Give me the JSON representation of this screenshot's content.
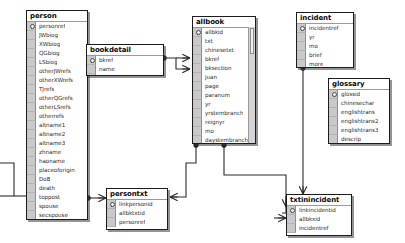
{
  "diagram": {
    "type": "entity-relationship-diagram",
    "background_color": "#ffffff",
    "line_color": "#2b2b2b"
  },
  "tables": [
    {
      "id": "person",
      "name": "person",
      "x": 26,
      "y": 10,
      "width": 62,
      "height": 210,
      "has_scrollbar": false,
      "fields": [
        {
          "name": "personref",
          "key": true
        },
        {
          "name": "JWbiog",
          "key": false
        },
        {
          "name": "XWbiog",
          "key": false
        },
        {
          "name": "QGbiog",
          "key": false
        },
        {
          "name": "LSbiog",
          "key": false
        },
        {
          "name": "otherJWrefs",
          "key": false
        },
        {
          "name": "otherXWrefs",
          "key": false
        },
        {
          "name": "TJrefs",
          "key": false
        },
        {
          "name": "otherQGrefs",
          "key": false
        },
        {
          "name": "otherLSrefs",
          "key": false
        },
        {
          "name": "otherrefs",
          "key": false
        },
        {
          "name": "altname1",
          "key": false
        },
        {
          "name": "altname2",
          "key": false
        },
        {
          "name": "altname3",
          "key": false
        },
        {
          "name": "zhname",
          "key": false
        },
        {
          "name": "haoname",
          "key": false
        },
        {
          "name": "placeoforigin",
          "key": false
        },
        {
          "name": "DoB",
          "key": false
        },
        {
          "name": "death",
          "key": false
        },
        {
          "name": "toppost",
          "key": false
        },
        {
          "name": "spouse",
          "key": false
        },
        {
          "name": "secspouse",
          "key": false
        },
        {
          "name": "children",
          "key": false
        },
        {
          "name": "briefdtls",
          "key": false
        }
      ]
    },
    {
      "id": "bookdetail",
      "name": "bookdetail",
      "x": 86,
      "y": 44,
      "width": 78,
      "height": 32,
      "has_scrollbar": false,
      "fields": [
        {
          "name": "bkref",
          "key": true
        },
        {
          "name": "name",
          "key": false
        },
        {
          "name": "detail",
          "key": false
        }
      ]
    },
    {
      "id": "allbook",
      "name": "allbook",
      "x": 192,
      "y": 16,
      "width": 64,
      "height": 128,
      "has_scrollbar": true,
      "fields": [
        {
          "name": "allbkid",
          "key": true
        },
        {
          "name": "txt",
          "key": false
        },
        {
          "name": "chinesetxt",
          "key": false
        },
        {
          "name": "bkref",
          "key": false
        },
        {
          "name": "bksection",
          "key": false
        },
        {
          "name": "juan",
          "key": false
        },
        {
          "name": "page",
          "key": false
        },
        {
          "name": "paranum",
          "key": false
        },
        {
          "name": "yr",
          "key": false
        },
        {
          "name": "yrstembranch",
          "key": false
        },
        {
          "name": "reignyr",
          "key": false
        },
        {
          "name": "mo",
          "key": false
        },
        {
          "name": "daystembranch",
          "key": false
        },
        {
          "name": "gregdate",
          "key": false
        }
      ]
    },
    {
      "id": "incident",
      "name": "incident",
      "x": 296,
      "y": 12,
      "width": 58,
      "height": 56,
      "has_scrollbar": false,
      "fields": [
        {
          "name": "incidentref",
          "key": true
        },
        {
          "name": "yr",
          "key": false
        },
        {
          "name": "mo",
          "key": false
        },
        {
          "name": "brief",
          "key": false
        },
        {
          "name": "more",
          "key": false
        }
      ]
    },
    {
      "id": "glossary",
      "name": "glossary",
      "x": 328,
      "y": 78,
      "width": 62,
      "height": 66,
      "has_scrollbar": false,
      "fields": [
        {
          "name": "glossid",
          "key": true
        },
        {
          "name": "chinesechar",
          "key": false
        },
        {
          "name": "englishtrans",
          "key": false
        },
        {
          "name": "englishtrans2",
          "key": false
        },
        {
          "name": "englishtrans3",
          "key": false
        },
        {
          "name": "descrip",
          "key": false
        }
      ]
    },
    {
      "id": "persontxt",
      "name": "persontxt",
      "x": 106,
      "y": 188,
      "width": 62,
      "height": 42,
      "has_scrollbar": false,
      "fields": [
        {
          "name": "linkpersonid",
          "key": true
        },
        {
          "name": "allbktxtid",
          "key": false
        },
        {
          "name": "personref",
          "key": false
        }
      ]
    },
    {
      "id": "txtinincident",
      "name": "txtinincident",
      "x": 286,
      "y": 194,
      "width": 66,
      "height": 42,
      "has_scrollbar": false,
      "fields": [
        {
          "name": "linkincidentid",
          "key": true
        },
        {
          "name": "allbkxid",
          "key": false
        },
        {
          "name": "incidentref",
          "key": false
        }
      ]
    }
  ],
  "relationships": [
    {
      "from": "bookdetail",
      "to": "allbook",
      "label": "bkref"
    },
    {
      "from": "allbook",
      "to": "persontxt",
      "label": "allbkid"
    },
    {
      "from": "person",
      "to": "persontxt",
      "label": "personref"
    },
    {
      "from": "allbook",
      "to": "txtinincident",
      "label": "allbkid"
    },
    {
      "from": "incident",
      "to": "txtinincident",
      "label": "incidentref"
    }
  ]
}
